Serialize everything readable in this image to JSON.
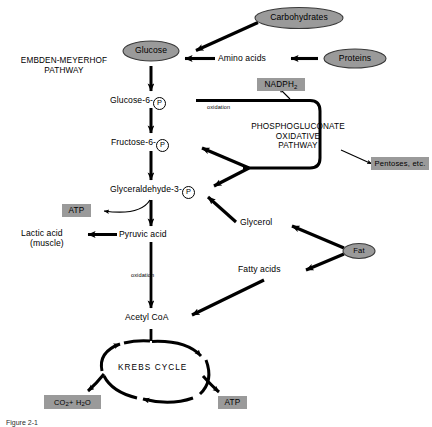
{
  "figure": {
    "caption": "Figure 2-1"
  },
  "palette": {
    "ellipse_fill": "#9a9a9a",
    "ellipse_stroke": "#3a3a3a",
    "box_fill": "#9a9a9a",
    "line": "#000000",
    "background": "#ffffff"
  },
  "sections": {
    "embden_meyerhof": "EMBDEN-MEYERHOF\nPATHWAY",
    "embden_meyerhof_line1": "EMBDEN-MEYERHOF",
    "embden_meyerhof_line2": "PATHWAY",
    "phosphogluconate_line1": "PHOSPHOGLUCONATE",
    "phosphogluconate_line2": "OXIDATIVE",
    "phosphogluconate_line3": "PATHWAY",
    "krebs": "KREBS  CYCLE"
  },
  "ellipse_nodes": [
    {
      "id": "carbohydrates",
      "label": "Carbohydrates"
    },
    {
      "id": "glucose",
      "label": "Glucose"
    },
    {
      "id": "proteins",
      "label": "Proteins"
    },
    {
      "id": "fat",
      "label": "Fat"
    }
  ],
  "text_nodes": [
    {
      "id": "amino-acids",
      "label": "Amino acids"
    },
    {
      "id": "glucose-6-p",
      "label": "Glucose-6-",
      "suffix": "P"
    },
    {
      "id": "fructose-6-p",
      "label": "Fructose-6-",
      "suffix": "P"
    },
    {
      "id": "glyceraldehyde-3-p",
      "label": "Glyceraldehyde-3-",
      "suffix": "P"
    },
    {
      "id": "pyruvic-acid",
      "label": "Pyruvic acid"
    },
    {
      "id": "lactic-acid-line1",
      "label": "Lactic acid"
    },
    {
      "id": "lactic-acid-line2",
      "label": "(muscle)"
    },
    {
      "id": "glycerol",
      "label": "Glycerol"
    },
    {
      "id": "fatty-acids",
      "label": "Fatty acids"
    },
    {
      "id": "acetyl-coa",
      "label": "Acetyl CoA"
    }
  ],
  "boxed_nodes": [
    {
      "id": "nadph2",
      "label": "NADPH",
      "sub": "2"
    },
    {
      "id": "pentoses",
      "label": "Pentoses, etc."
    },
    {
      "id": "atp-glycolysis",
      "label": "ATP"
    },
    {
      "id": "atp-krebs",
      "label": "ATP"
    },
    {
      "id": "co2-h2o",
      "label": "CO2 + H2O"
    }
  ],
  "annotations": [
    {
      "id": "oxidation-g6p",
      "label": "oxidation"
    },
    {
      "id": "oxidation-pyruvate",
      "label": "oxidation"
    }
  ],
  "node_labels": {
    "carbohydrates": "Carbohydrates",
    "glucose": "Glucose",
    "proteins": "Proteins",
    "fat": "Fat",
    "amino_acids": "Amino acids",
    "glucose6p": "Glucose-6-",
    "fructose6p": "Fructose-6-",
    "glyceraldehyde3p": "Glyceraldehyde-3-",
    "phosphate_symbol": "P",
    "pyruvic_acid": "Pyruvic acid",
    "lactic_acid": "Lactic acid",
    "lactic_acid_qualifier": "(muscle)",
    "glycerol": "Glycerol",
    "fatty_acids": "Fatty acids",
    "acetyl_coa": "Acetyl CoA",
    "nadph2": "NADPH",
    "nadph2_sub": "2",
    "pentoses": "Pentoses, etc.",
    "atp": "ATP",
    "co2": "CO",
    "co2_sub": "2",
    "plus": " + H",
    "h2o_sub": "2",
    "h2o_end": "O",
    "oxidation": "oxidation"
  },
  "flow_edges": [
    {
      "from": "carbohydrates",
      "to": "glucose"
    },
    {
      "from": "proteins",
      "to": "amino-acids"
    },
    {
      "from": "amino-acids",
      "to": "glucose"
    },
    {
      "from": "glucose",
      "to": "glucose-6-p"
    },
    {
      "from": "glucose-6-p",
      "to": "phosphogluconate-pathway"
    },
    {
      "from": "glucose-6-p",
      "to": "fructose-6-p"
    },
    {
      "from": "phosphogluconate-pathway",
      "to": "nadph2"
    },
    {
      "from": "phosphogluconate-pathway",
      "to": "pentoses"
    },
    {
      "from": "phosphogluconate-pathway",
      "to": "fructose-6-p"
    },
    {
      "from": "phosphogluconate-pathway",
      "to": "glyceraldehyde-3-p"
    },
    {
      "from": "fructose-6-p",
      "to": "glyceraldehyde-3-p"
    },
    {
      "from": "glyceraldehyde-3-p",
      "to": "atp-glycolysis"
    },
    {
      "from": "glyceraldehyde-3-p",
      "to": "pyruvic-acid"
    },
    {
      "from": "glycerol",
      "to": "glyceraldehyde-3-p"
    },
    {
      "from": "pyruvic-acid",
      "to": "lactic-acid"
    },
    {
      "from": "pyruvic-acid",
      "to": "acetyl-coa"
    },
    {
      "from": "fat",
      "to": "glycerol"
    },
    {
      "from": "fat",
      "to": "fatty-acids"
    },
    {
      "from": "fatty-acids",
      "to": "acetyl-coa"
    },
    {
      "from": "acetyl-coa",
      "to": "krebs-cycle"
    },
    {
      "from": "krebs-cycle",
      "to": "co2-h2o"
    },
    {
      "from": "krebs-cycle",
      "to": "atp-krebs"
    }
  ]
}
